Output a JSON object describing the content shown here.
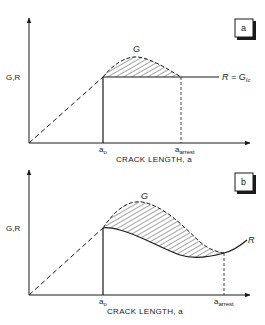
{
  "figure": {
    "panels": [
      {
        "id": "a",
        "tag": "a",
        "y_axis_label": "G,R",
        "x_axis_label": "CRACK LENGTH, a",
        "x_ticks": {
          "a0_main": "a",
          "a0_sub": "o",
          "arrest_main": "a",
          "arrest_sub": "arrest"
        },
        "curve_labels": {
          "G": "G",
          "R_eq_main": "R = G",
          "R_eq_sub": "Ic"
        }
      },
      {
        "id": "b",
        "tag": "b",
        "y_axis_label": "G,R",
        "x_axis_label": "CRACK LENGTH, a",
        "x_ticks": {
          "a0_main": "a",
          "a0_sub": "o",
          "arrest_main": "a",
          "arrest_sub": "arrest"
        },
        "curve_labels": {
          "G": "G",
          "R": "R"
        }
      }
    ],
    "colors": {
      "ink": "#1a1a1a",
      "background": "#ffffff"
    }
  }
}
